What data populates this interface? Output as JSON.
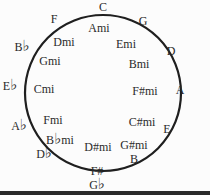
{
  "circle": {
    "cx": 103,
    "cy": 93,
    "r": 78,
    "stroke": "#1f1f1f"
  },
  "major_keys": [
    {
      "label": "C",
      "x": 103,
      "y": 7
    },
    {
      "label": "G",
      "x": 143,
      "y": 21
    },
    {
      "label": "D",
      "x": 171,
      "y": 51
    },
    {
      "label": "A",
      "x": 180,
      "y": 90
    },
    {
      "label": "E",
      "x": 167,
      "y": 129
    },
    {
      "label": "B",
      "x": 134,
      "y": 159
    },
    {
      "label": "F#",
      "x": 97,
      "y": 171
    },
    {
      "label": "G♭",
      "x": 97,
      "y": 184
    },
    {
      "label": "D♭",
      "x": 44,
      "y": 153
    },
    {
      "label": "A♭",
      "x": 19,
      "y": 125
    },
    {
      "label": "E♭",
      "x": 10,
      "y": 85
    },
    {
      "label": "B♭",
      "x": 22,
      "y": 46
    },
    {
      "label": "F",
      "x": 54,
      "y": 19
    }
  ],
  "minor_keys": [
    {
      "label": "Ami",
      "x": 99,
      "y": 28
    },
    {
      "label": "Emi",
      "x": 126,
      "y": 44
    },
    {
      "label": "Bmi",
      "x": 139,
      "y": 64
    },
    {
      "label": "F#mi",
      "x": 145,
      "y": 91
    },
    {
      "label": "C#mi",
      "x": 142,
      "y": 122
    },
    {
      "label": "G#mi",
      "x": 134,
      "y": 145
    },
    {
      "label": "D#mi",
      "x": 98,
      "y": 147
    },
    {
      "label": "B♭mi",
      "x": 60,
      "y": 139
    },
    {
      "label": "Fmi",
      "x": 53,
      "y": 120
    },
    {
      "label": "Cmi",
      "x": 44,
      "y": 89
    },
    {
      "label": "Gmi",
      "x": 50,
      "y": 61
    },
    {
      "label": "Dmi",
      "x": 64,
      "y": 42
    }
  ]
}
